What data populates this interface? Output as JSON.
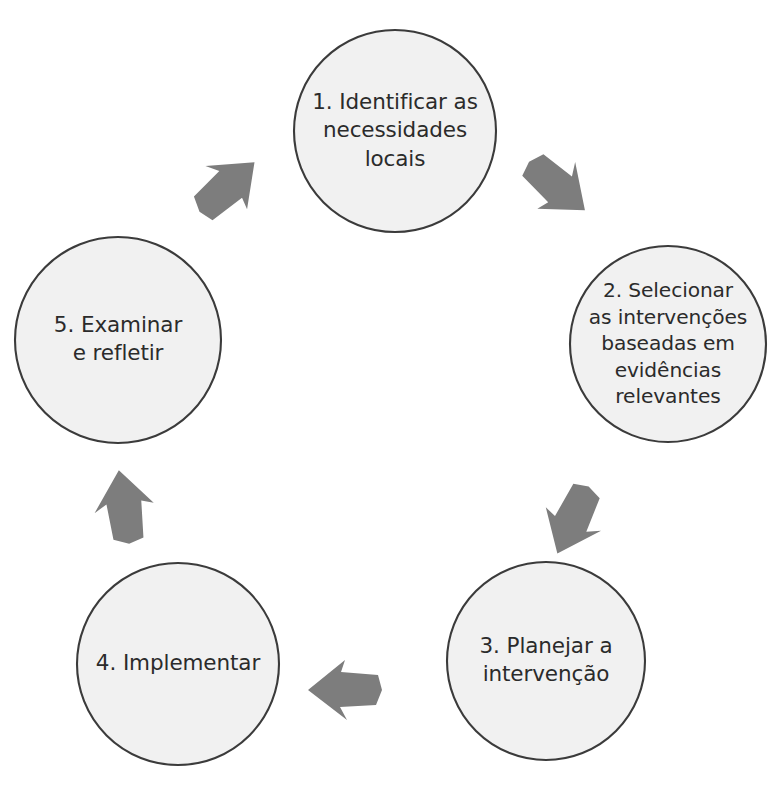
{
  "diagram": {
    "type": "cycle",
    "title": "",
    "background_color": "#ffffff",
    "node_fill_color": "#f1f1f1",
    "node_border_color": "#3b3b3b",
    "text_color": "#2b2b2b",
    "arrow_color": "#7d7d7d",
    "nodes": [
      {
        "id": "step-1",
        "number": "1.",
        "text": "1. Identificar as necessidades locais",
        "lines": [
          "1. Identificar as",
          "necessidades",
          "locais"
        ],
        "cx": 395,
        "cy": 131,
        "r": 101
      },
      {
        "id": "step-2",
        "number": "2.",
        "text": "2. Selecionar as intervenções baseadas em evidências relevantes",
        "lines": [
          "2. Selecionar",
          "as intervenções",
          "baseadas em",
          "evidências",
          "relevantes"
        ],
        "cx": 668,
        "cy": 344,
        "r": 98
      },
      {
        "id": "step-3",
        "number": "3.",
        "text": "3. Planejar a intervenção",
        "lines": [
          "3. Planejar a",
          "intervenção"
        ],
        "cx": 546,
        "cy": 661,
        "r": 99
      },
      {
        "id": "step-4",
        "number": "4.",
        "text": "4. Implementar",
        "lines": [
          "4. Implementar"
        ],
        "cx": 178,
        "cy": 664,
        "r": 101
      },
      {
        "id": "step-5",
        "number": "5.",
        "text": "5. Examinar e refletir",
        "lines": [
          "5. Examinar",
          "e refletir"
        ],
        "cx": 118,
        "cy": 340,
        "r": 103
      }
    ],
    "arrows": [
      {
        "id": "arrow-5-to-1",
        "from": "step-5",
        "to": "step-1",
        "direction": "up-right",
        "cx": 227,
        "cy": 187,
        "rotation": 48
      },
      {
        "id": "arrow-1-to-2",
        "from": "step-1",
        "to": "step-2",
        "direction": "down-right",
        "cx": 557,
        "cy": 186,
        "rotation": 131
      },
      {
        "id": "arrow-2-to-3",
        "from": "step-2",
        "to": "step-3",
        "direction": "down-left",
        "cx": 573,
        "cy": 520,
        "rotation": 205
      },
      {
        "id": "arrow-3-to-4",
        "from": "step-3",
        "to": "step-4",
        "direction": "left",
        "cx": 345,
        "cy": 690,
        "rotation": 270
      },
      {
        "id": "arrow-4-to-5",
        "from": "step-4",
        "to": "step-5",
        "direction": "up",
        "cx": 124,
        "cy": 507,
        "rotation": 352
      }
    ]
  }
}
